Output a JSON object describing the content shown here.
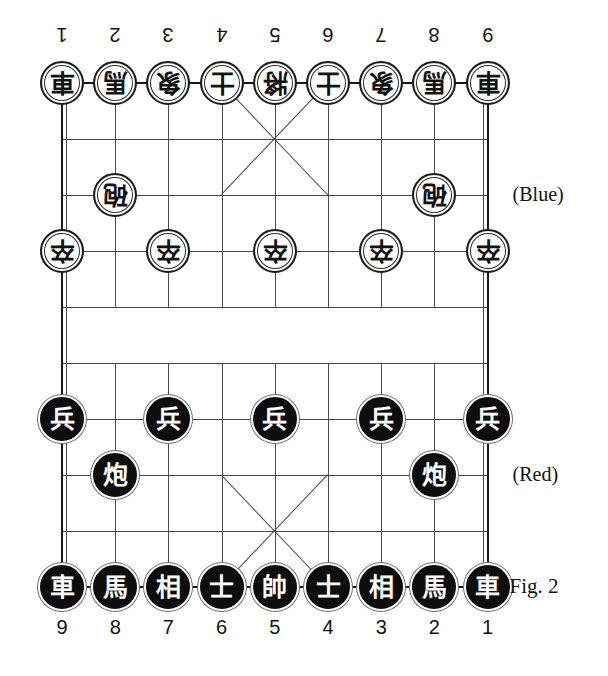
{
  "figure": {
    "caption": "Fig. 2",
    "side_labels": {
      "top": "(Blue)",
      "bottom": "(Red)"
    }
  },
  "board": {
    "files": 9,
    "ranks": 10,
    "origin_x": 62,
    "origin_y": 83,
    "file_spacing": 53.2,
    "rank_spacing": 56.0,
    "river_top_rank": 4,
    "river_bottom_rank": 5,
    "colors": {
      "grid": "#4a4a4a",
      "border": "#1b1b1b",
      "blue_piece_face": "#ffffff",
      "blue_piece_glyph": "#121212",
      "red_piece_face": "#0d0d0d",
      "red_piece_glyph": "#ffffff"
    }
  },
  "file_labels": {
    "top": [
      "1",
      "2",
      "3",
      "4",
      "5",
      "6",
      "7",
      "8",
      "9"
    ],
    "bottom": [
      "9",
      "8",
      "7",
      "6",
      "5",
      "4",
      "3",
      "2",
      "1"
    ]
  },
  "pieces": [
    {
      "glyph": "車",
      "side": "blue",
      "name": "chariot",
      "file": 1,
      "rank": 0
    },
    {
      "glyph": "馬",
      "side": "blue",
      "name": "horse",
      "file": 2,
      "rank": 0
    },
    {
      "glyph": "象",
      "side": "blue",
      "name": "elephant",
      "file": 3,
      "rank": 0
    },
    {
      "glyph": "士",
      "side": "blue",
      "name": "advisor",
      "file": 4,
      "rank": 0
    },
    {
      "glyph": "將",
      "side": "blue",
      "name": "general",
      "file": 5,
      "rank": 0
    },
    {
      "glyph": "士",
      "side": "blue",
      "name": "advisor",
      "file": 6,
      "rank": 0
    },
    {
      "glyph": "象",
      "side": "blue",
      "name": "elephant",
      "file": 7,
      "rank": 0
    },
    {
      "glyph": "馬",
      "side": "blue",
      "name": "horse",
      "file": 8,
      "rank": 0
    },
    {
      "glyph": "車",
      "side": "blue",
      "name": "chariot",
      "file": 9,
      "rank": 0
    },
    {
      "glyph": "砲",
      "side": "blue",
      "name": "cannon",
      "file": 2,
      "rank": 2
    },
    {
      "glyph": "砲",
      "side": "blue",
      "name": "cannon",
      "file": 8,
      "rank": 2
    },
    {
      "glyph": "卒",
      "side": "blue",
      "name": "pawn",
      "file": 1,
      "rank": 3
    },
    {
      "glyph": "卒",
      "side": "blue",
      "name": "pawn",
      "file": 3,
      "rank": 3
    },
    {
      "glyph": "卒",
      "side": "blue",
      "name": "pawn",
      "file": 5,
      "rank": 3
    },
    {
      "glyph": "卒",
      "side": "blue",
      "name": "pawn",
      "file": 7,
      "rank": 3
    },
    {
      "glyph": "卒",
      "side": "blue",
      "name": "pawn",
      "file": 9,
      "rank": 3
    },
    {
      "glyph": "兵",
      "side": "red",
      "name": "pawn",
      "file": 1,
      "rank": 6
    },
    {
      "glyph": "兵",
      "side": "red",
      "name": "pawn",
      "file": 3,
      "rank": 6
    },
    {
      "glyph": "兵",
      "side": "red",
      "name": "pawn",
      "file": 5,
      "rank": 6
    },
    {
      "glyph": "兵",
      "side": "red",
      "name": "pawn",
      "file": 7,
      "rank": 6
    },
    {
      "glyph": "兵",
      "side": "red",
      "name": "pawn",
      "file": 9,
      "rank": 6
    },
    {
      "glyph": "炮",
      "side": "red",
      "name": "cannon",
      "file": 2,
      "rank": 7
    },
    {
      "glyph": "炮",
      "side": "red",
      "name": "cannon",
      "file": 8,
      "rank": 7
    },
    {
      "glyph": "車",
      "side": "red",
      "name": "chariot",
      "file": 1,
      "rank": 9
    },
    {
      "glyph": "馬",
      "side": "red",
      "name": "horse",
      "file": 2,
      "rank": 9
    },
    {
      "glyph": "相",
      "side": "red",
      "name": "elephant",
      "file": 3,
      "rank": 9
    },
    {
      "glyph": "士",
      "side": "red",
      "name": "advisor",
      "file": 4,
      "rank": 9
    },
    {
      "glyph": "帥",
      "side": "red",
      "name": "general",
      "file": 5,
      "rank": 9
    },
    {
      "glyph": "士",
      "side": "red",
      "name": "advisor",
      "file": 6,
      "rank": 9
    },
    {
      "glyph": "相",
      "side": "red",
      "name": "elephant",
      "file": 7,
      "rank": 9
    },
    {
      "glyph": "馬",
      "side": "red",
      "name": "horse",
      "file": 8,
      "rank": 9
    },
    {
      "glyph": "車",
      "side": "red",
      "name": "chariot",
      "file": 9,
      "rank": 9
    }
  ]
}
